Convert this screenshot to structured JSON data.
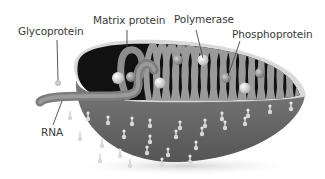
{
  "diagram": {
    "labels": {
      "glycoprotein": "Glycoprotein",
      "matrix_protein": "Matrix protein",
      "polymerase": "Polymerase",
      "phosphoprotein": "Phosphoprotein",
      "rna": "RNA"
    },
    "colors": {
      "envelope": "#6e6e6e",
      "interior": "#111111",
      "coil": "#9a9a9a",
      "rim": "#d8d8d8",
      "spike": "#cfcfcf",
      "label_text": "#3a3a3a",
      "leader_line": "#444444"
    }
  }
}
